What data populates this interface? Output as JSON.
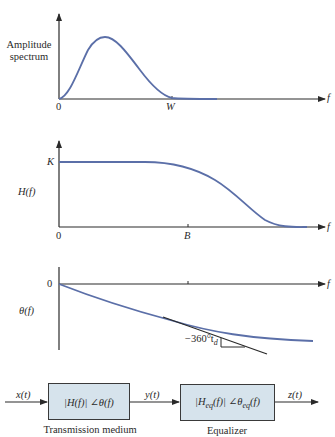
{
  "panel_amplitude": {
    "ylabel_line1": "Amplitude",
    "ylabel_line2": "spectrum",
    "origin": "0",
    "tick_W": "W",
    "xaxis": "f"
  },
  "panel_magnitude": {
    "ylabel": "H(f)",
    "level_K": "K",
    "origin": "0",
    "tick_B": "B",
    "xaxis": "f"
  },
  "panel_phase": {
    "ylabel": "θ(f)",
    "zero": "0",
    "slope_label": "−360°t",
    "slope_sub": "d",
    "xaxis": "f"
  },
  "block_diagram": {
    "input": "x(t)",
    "block1_text": "|H(f)| ∠θ(f)",
    "block1_caption": "Transmission medium",
    "intermediate": "y(t)",
    "block2_text_pre": "|H",
    "block2_sub1": "eq",
    "block2_text_mid": "(f)| ∠θ",
    "block2_sub2": "eq",
    "block2_text_post": "(f)",
    "block2_caption": "Equalizer",
    "output": "z(t)"
  },
  "colors": {
    "curve": "#5b6fa8",
    "axis": "#2a2a2a",
    "block_fill": "#d6e3ec"
  }
}
